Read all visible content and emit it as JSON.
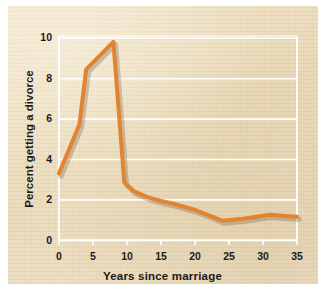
{
  "figure": {
    "panel_bg": "#ecdcbe",
    "page_bg": "#ffffff",
    "line_color": "#e2842f",
    "grid_color": "#ffffff",
    "axis_color": "#ffffff",
    "text_color": "#1b1b1b"
  },
  "chart_data": {
    "type": "line",
    "title": "",
    "xlabel": "Years since marriage",
    "ylabel": "Percent getting a divorce",
    "xlim": [
      0,
      35
    ],
    "ylim": [
      0,
      10.4
    ],
    "xticks": [
      0,
      5,
      10,
      15,
      20,
      25,
      30,
      35
    ],
    "xtick_labels": [
      "0",
      "5",
      "10",
      "15",
      "20",
      "25",
      "30",
      "35"
    ],
    "yticks": [
      0,
      2,
      4,
      6,
      8,
      10
    ],
    "ytick_labels": [
      "0",
      "2",
      "4",
      "6",
      "8",
      "10"
    ],
    "grid": "horizontal",
    "legend": "none",
    "series": [
      {
        "name": "Percent getting a divorce",
        "color": "#e2842f",
        "line_width": 4,
        "x": [
          0,
          3,
          4,
          8,
          9.6,
          11,
          13,
          15,
          17,
          20,
          24,
          27,
          31,
          35
        ],
        "y": [
          3.4,
          5.9,
          8.7,
          10.1,
          2.95,
          2.5,
          2.2,
          2.0,
          1.85,
          1.55,
          1.0,
          1.1,
          1.3,
          1.2
        ]
      }
    ]
  }
}
